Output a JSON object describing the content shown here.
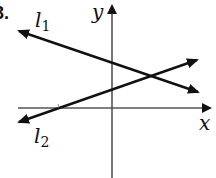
{
  "problem": {
    "number": "3."
  },
  "axes": {
    "x_label": "x",
    "y_label": "y",
    "origin_px": [
      112,
      108
    ],
    "color": "#555555"
  },
  "lines": [
    {
      "name": "l",
      "subscript": "1",
      "description": "negative slope line, arrows both ends",
      "start_px": [
        19,
        31
      ],
      "end_px": [
        198,
        92
      ],
      "color": "#111111"
    },
    {
      "name": "l",
      "subscript": "2",
      "description": "positive slope line, arrows both ends, positive x-intercept? no — crosses x-axis left of origin",
      "start_px": [
        19,
        122
      ],
      "end_px": [
        197,
        60
      ],
      "color": "#111111"
    }
  ],
  "intersection_px": [
    152,
    73
  ]
}
